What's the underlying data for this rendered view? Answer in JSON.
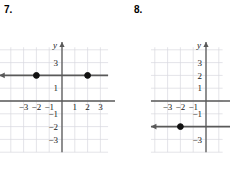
{
  "problems": [
    {
      "number": "7.",
      "number_pos": {
        "x": 4,
        "y": 4
      },
      "graph": {
        "name": "coordinate-plane-7",
        "origin": {
          "x": 62,
          "y": 101
        },
        "unit": 12.8,
        "grid": {
          "x_min": -4.9,
          "x_max": 3.6,
          "y_min": -4.0,
          "y_max": 4.2,
          "color": "#d9d9e0",
          "visible": true
        },
        "x_axis": {
          "label": "x",
          "arrow_right": true,
          "arrow_left": false,
          "from": -4.9,
          "to": 4.7
        },
        "y_axis": {
          "label": "y",
          "arrow_up": true,
          "from": -4.0,
          "to": 4.6
        },
        "x_ticks": [
          {
            "value": -3,
            "label": "−3"
          },
          {
            "value": -2,
            "label": "−2"
          },
          {
            "value": -1,
            "label": "−1"
          },
          {
            "value": 1,
            "label": "1"
          },
          {
            "value": 2,
            "label": "2"
          },
          {
            "value": 3,
            "label": "3"
          }
        ],
        "y_ticks": [
          {
            "value": 3,
            "label": "3"
          },
          {
            "value": 1,
            "label": "1"
          },
          {
            "value": -1,
            "label": "−1"
          },
          {
            "value": -2,
            "label": "−2"
          },
          {
            "value": -3,
            "label": "−3"
          }
        ],
        "plot": {
          "type": "horizontal-line",
          "equation_y": 2,
          "from_x": -4.9,
          "to_x": 3.6,
          "arrow_left": true,
          "arrow_right": false,
          "color": "#595959",
          "points": [
            {
              "x": -2,
              "y": 2,
              "filled": true
            },
            {
              "x": 2,
              "y": 2,
              "filled": true
            }
          ]
        }
      }
    },
    {
      "number": "8.",
      "number_pos": {
        "x": 134,
        "y": 4
      },
      "graph": {
        "name": "coordinate-plane-8",
        "origin": {
          "x": 91,
          "y": 101
        },
        "unit": 12.8,
        "grid": {
          "x_min": -4.3,
          "x_max": 1.3,
          "y_min": -4.0,
          "y_max": 4.2,
          "color": "#d9d9e0",
          "visible": true
        },
        "x_axis": {
          "label": "",
          "arrow_right": false,
          "arrow_left": false,
          "from": -4.3,
          "to": 1.9
        },
        "y_axis": {
          "label": "y",
          "arrow_up": true,
          "from": -4.0,
          "to": 4.6
        },
        "x_ticks": [
          {
            "value": -3,
            "label": "−3"
          },
          {
            "value": -2,
            "label": "−2"
          },
          {
            "value": -1,
            "label": "−1"
          }
        ],
        "y_ticks": [
          {
            "value": 3,
            "label": "3"
          },
          {
            "value": 2,
            "label": "2"
          },
          {
            "value": 1,
            "label": "1"
          },
          {
            "value": -1,
            "label": "−1"
          },
          {
            "value": -3,
            "label": "−3"
          }
        ],
        "plot": {
          "type": "horizontal-line",
          "equation_y": -2,
          "from_x": -4.3,
          "to_x": 1.9,
          "arrow_left": true,
          "arrow_right": false,
          "color": "#595959",
          "points": [
            {
              "x": -2,
              "y": -2,
              "filled": true
            }
          ]
        }
      }
    }
  ],
  "style": {
    "axis_color": "#595959",
    "grid_color": "#d9d9e0",
    "text_color": "#1a1a1a",
    "background": "#ffffff"
  }
}
